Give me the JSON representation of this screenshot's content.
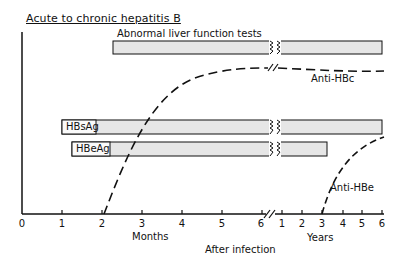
{
  "title": "Acute to chronic hepatitis B",
  "bars": [
    {
      "label": "Abnormal liver function tests",
      "start": "2.25 months",
      "end": "6 years"
    },
    {
      "label": "HBsAg",
      "start": "1 month",
      "end": "6 years"
    },
    {
      "label": "HBeAg",
      "start": "1.25 months",
      "end": "3.25 years"
    }
  ],
  "curves": [
    {
      "label": "Anti-HBc",
      "style": "dashed",
      "start": "2.1 months",
      "plateau": "from ~1 year"
    },
    {
      "label": "Anti-HBe",
      "style": "dashed",
      "start": "3 years",
      "end": "6 years"
    }
  ],
  "x_axis": {
    "months_ticks": [
      "0",
      "1",
      "2",
      "3",
      "4",
      "5",
      "6"
    ],
    "years_ticks": [
      "1",
      "2",
      "3",
      "4",
      "5",
      "6"
    ],
    "months_label": "Months",
    "years_label": "Years",
    "caption": "After infection"
  },
  "colors": {
    "bar_fill": "#e6e6e6",
    "line": "#111111",
    "background": "#ffffff"
  }
}
